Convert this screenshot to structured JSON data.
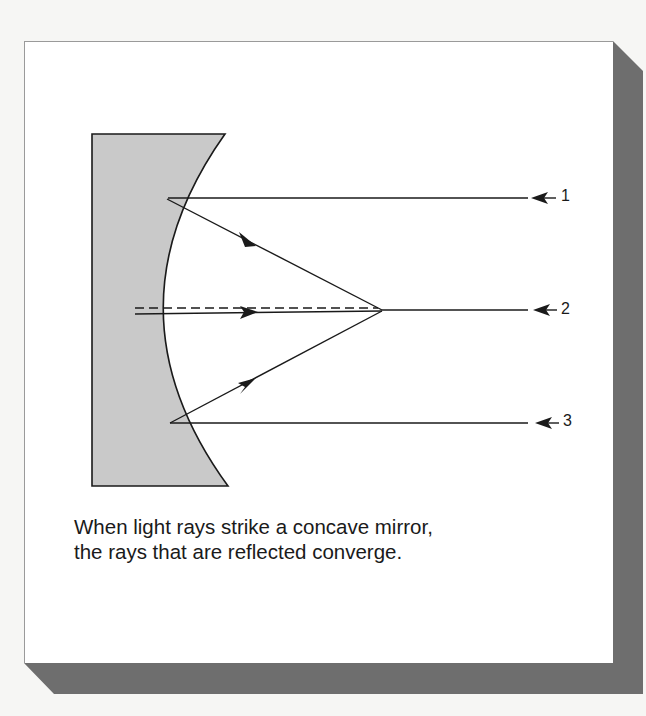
{
  "figure": {
    "caption_lines": [
      "When light rays strike a concave mirror,",
      "the rays that are reflected converge."
    ],
    "ray_labels": [
      "1",
      "2",
      "3"
    ],
    "colors": {
      "mirror_fill": "#c9c9c9",
      "line": "#1a1a1a",
      "shadow": "#6e6e6e",
      "card": "#ffffff",
      "background": "#f6f6f4"
    },
    "elements": {
      "mirror": "concave mirror (gray, curved reflecting surface facing right)",
      "incident_rays": 3,
      "reflected_rays": 3,
      "focal_point": "rays converge at a point on the principal axis",
      "principal_axis": "dashed line"
    }
  }
}
